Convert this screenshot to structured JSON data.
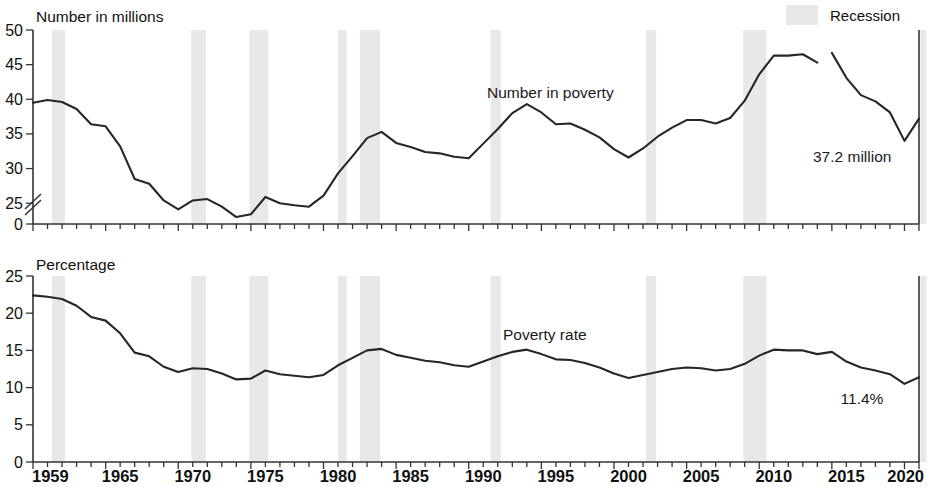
{
  "legend": {
    "recession_label": "Recession",
    "recession_color": "#e8e8e8"
  },
  "panels": {
    "top": {
      "axis_label": "Number in millions",
      "series_label": "Number in poverty",
      "end_annotation": "37.2 million",
      "y_ticks": [
        "0",
        "25",
        "30",
        "35",
        "40",
        "45",
        "50"
      ],
      "axis_break": true
    },
    "bottom": {
      "axis_label": "Percentage",
      "series_label": "Poverty rate",
      "end_annotation": "11.4%",
      "y_ticks": [
        "0",
        "5",
        "10",
        "15",
        "20",
        "25"
      ]
    }
  },
  "x_axis": {
    "tick_labels": [
      "1959",
      "1965",
      "1970",
      "1975",
      "1980",
      "1985",
      "1990",
      "1995",
      "2000",
      "2005",
      "2010",
      "2015",
      "2020"
    ],
    "range": [
      1959,
      2020
    ]
  },
  "chart_data": {
    "type": "line",
    "xlabel": "",
    "panels": [
      {
        "name": "Number in poverty",
        "ylabel": "Number in millions",
        "ylim": [
          22,
          50
        ],
        "axis_break_below": 22,
        "y_ticks": [
          25,
          30,
          35,
          40,
          45,
          50
        ],
        "end_annotation": "37.2 million",
        "x": [
          1959,
          1960,
          1961,
          1962,
          1963,
          1964,
          1965,
          1966,
          1967,
          1968,
          1969,
          1970,
          1971,
          1972,
          1973,
          1974,
          1975,
          1976,
          1977,
          1978,
          1979,
          1980,
          1981,
          1982,
          1983,
          1984,
          1985,
          1986,
          1987,
          1988,
          1989,
          1990,
          1991,
          1992,
          1993,
          1994,
          1995,
          1996,
          1997,
          1998,
          1999,
          2000,
          2001,
          2002,
          2003,
          2004,
          2005,
          2006,
          2007,
          2008,
          2009,
          2010,
          2011,
          2012,
          2013,
          2014,
          2015,
          2016,
          2017,
          2018,
          2019,
          2020
        ],
        "values": [
          39.5,
          39.9,
          39.6,
          38.6,
          36.4,
          36.1,
          33.2,
          28.5,
          27.8,
          25.4,
          24.1,
          25.4,
          25.6,
          24.5,
          23.0,
          23.4,
          25.9,
          25.0,
          24.7,
          24.5,
          26.1,
          29.3,
          31.8,
          34.4,
          35.3,
          33.7,
          33.1,
          32.4,
          32.2,
          31.7,
          31.5,
          33.6,
          35.7,
          38.0,
          39.3,
          38.1,
          36.4,
          36.5,
          35.6,
          34.5,
          32.8,
          31.6,
          32.9,
          34.6,
          35.9,
          37.0,
          37.0,
          36.5,
          37.3,
          39.8,
          43.6,
          46.3,
          46.3,
          46.5,
          45.3,
          46.7,
          43.1,
          40.6,
          39.7,
          38.1,
          34.0,
          37.2
        ]
      },
      {
        "name": "Poverty rate",
        "ylabel": "Percentage",
        "ylim": [
          0,
          25
        ],
        "y_ticks": [
          0,
          5,
          10,
          15,
          20,
          25
        ],
        "end_annotation": "11.4%",
        "x": [
          1959,
          1960,
          1961,
          1962,
          1963,
          1964,
          1965,
          1966,
          1967,
          1968,
          1969,
          1970,
          1971,
          1972,
          1973,
          1974,
          1975,
          1976,
          1977,
          1978,
          1979,
          1980,
          1981,
          1982,
          1983,
          1984,
          1985,
          1986,
          1987,
          1988,
          1989,
          1990,
          1991,
          1992,
          1993,
          1994,
          1995,
          1996,
          1997,
          1998,
          1999,
          2000,
          2001,
          2002,
          2003,
          2004,
          2005,
          2006,
          2007,
          2008,
          2009,
          2010,
          2011,
          2012,
          2013,
          2014,
          2015,
          2016,
          2017,
          2018,
          2019,
          2020
        ],
        "values": [
          22.4,
          22.2,
          21.9,
          21.0,
          19.5,
          19.0,
          17.3,
          14.7,
          14.2,
          12.8,
          12.1,
          12.6,
          12.5,
          11.9,
          11.1,
          11.2,
          12.3,
          11.8,
          11.6,
          11.4,
          11.7,
          13.0,
          14.0,
          15.0,
          15.2,
          14.4,
          14.0,
          13.6,
          13.4,
          13.0,
          12.8,
          13.5,
          14.2,
          14.8,
          15.1,
          14.5,
          13.8,
          13.7,
          13.3,
          12.7,
          11.9,
          11.3,
          11.7,
          12.1,
          12.5,
          12.7,
          12.6,
          12.3,
          12.5,
          13.2,
          14.3,
          15.1,
          15.0,
          15.0,
          14.5,
          14.8,
          13.5,
          12.7,
          12.3,
          11.8,
          10.5,
          11.4
        ]
      }
    ],
    "recessions": [
      [
        1960.3,
        1961.2
      ],
      [
        1969.9,
        1970.9
      ],
      [
        1973.9,
        1975.2
      ],
      [
        1980.0,
        1980.6
      ],
      [
        1981.5,
        1982.9
      ],
      [
        1990.5,
        1991.2
      ],
      [
        2001.2,
        2001.9
      ],
      [
        2007.9,
        2009.5
      ],
      [
        2020.1,
        2020.4
      ]
    ],
    "legend": [
      "Recession"
    ],
    "grid": false,
    "legend_position": "top-right"
  }
}
